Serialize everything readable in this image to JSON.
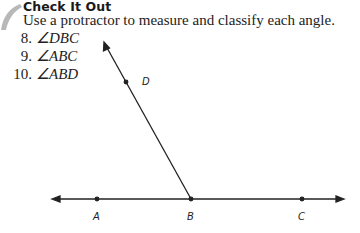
{
  "section": {
    "heading": "Check It Out",
    "instruction": "Use a protractor to measure and classify each angle."
  },
  "exercises": [
    {
      "number": "8.",
      "angle": "∠DBC"
    },
    {
      "number": "9.",
      "angle": "∠ABC"
    },
    {
      "number": "10.",
      "angle": "∠ABD"
    }
  ],
  "diagram": {
    "points": {
      "A": {
        "label": "A"
      },
      "B": {
        "label": "B"
      },
      "C": {
        "label": "C"
      },
      "D": {
        "label": "D"
      }
    },
    "line_color": "#222222"
  }
}
